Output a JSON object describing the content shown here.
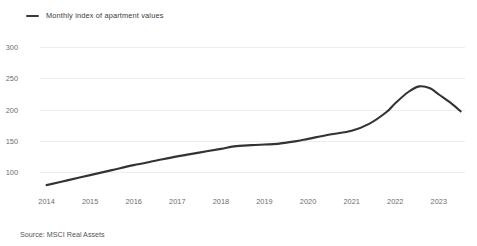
{
  "legend": {
    "marker": "line-swatch",
    "label": "Monthly index of apartment values",
    "position": "top-left",
    "color": "#3a3a3a"
  },
  "source": {
    "text": "Source: MSCI Real Assets"
  },
  "chart_data": {
    "type": "line",
    "title": "",
    "subtitle": "",
    "xlabel": "",
    "ylabel": "",
    "grid": true,
    "legend_position": "top-left",
    "line_color": "#333333",
    "background": "#ffffff",
    "xlim": [
      2013.85,
      2023.6
    ],
    "ylim": [
      50,
      300
    ],
    "yticks": [
      300,
      250,
      200,
      150,
      100
    ],
    "ytick_labels": [
      "300",
      "250",
      "200",
      "150",
      "100"
    ],
    "xticks": [
      2014,
      2015,
      2016,
      2017,
      2018,
      2019,
      2020,
      2021,
      2022,
      2023
    ],
    "xtick_labels": [
      "2014",
      "2015",
      "2016",
      "2017",
      "2018",
      "2019",
      "2020",
      "2021",
      "2022",
      "2023"
    ],
    "series": [
      {
        "name": "Monthly index of apartment values",
        "x": [
          2014.0,
          2014.5,
          2015.0,
          2015.5,
          2016.0,
          2016.5,
          2017.0,
          2017.5,
          2018.0,
          2018.3,
          2018.7,
          2019.0,
          2019.3,
          2019.7,
          2020.0,
          2020.5,
          2021.0,
          2021.4,
          2021.8,
          2022.0,
          2022.3,
          2022.55,
          2022.8,
          2023.0,
          2023.3,
          2023.5
        ],
        "values": [
          79,
          87,
          95,
          103,
          111,
          118,
          125,
          131,
          137,
          141,
          143,
          144,
          145,
          149,
          153,
          160,
          166,
          177,
          196,
          210,
          228,
          237,
          234,
          224,
          209,
          197
        ]
      }
    ]
  }
}
